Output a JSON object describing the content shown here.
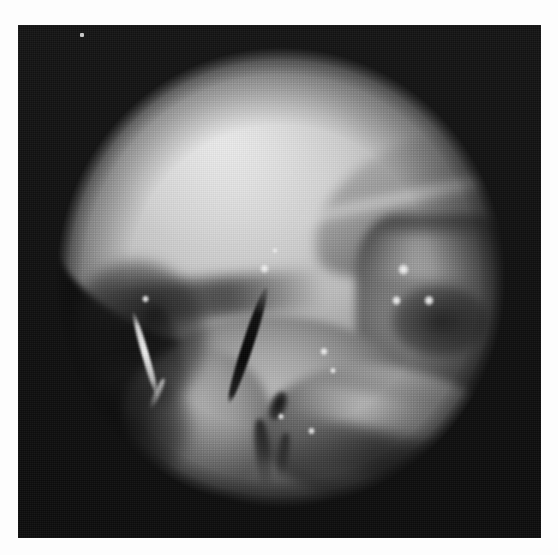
{
  "image": {
    "title": "Endoscopic grayscale photograph",
    "modality": "endoscopy",
    "color_mode": "grayscale",
    "width_px": 558,
    "height_px": 555,
    "border": {
      "color": "#fdfdfd",
      "left_px": 18,
      "top_px": 25,
      "right_px": 17,
      "bottom_px": 17
    },
    "plate": {
      "background_color": "#0e0e0e",
      "x_px": 18,
      "y_px": 25,
      "width_px": 523,
      "height_px": 513
    },
    "field_of_view": {
      "shape": "circle",
      "center_x_px": 263,
      "center_y_px": 253,
      "radius_px": 225,
      "description": "circular endoscope aperture with dark surround"
    },
    "dominant_colors": {
      "background_dark": "#101010",
      "tissue_bright": "#d8d8d8",
      "tissue_mid": "#8e8e8e",
      "tissue_shadow": "#3c3c3c",
      "specular_white": "#fcfcfc"
    },
    "structures": [
      {
        "name": "upper-tissue-dome",
        "description": "Large smooth bright dome-shaped tissue mass occupying the upper half",
        "brightness": "bright"
      },
      {
        "name": "upper-right-fold",
        "description": "Diagonal tissue fold along the upper right shoulder",
        "brightness": "mid"
      },
      {
        "name": "right-lateral-block",
        "description": "Ridged darker tissue block on the right side with specular highlights",
        "brightness": "mid-dark"
      },
      {
        "name": "lower-central-lobe",
        "description": "Rounded tissue lobe in the lower centre",
        "brightness": "mid-bright"
      },
      {
        "name": "lower-right-ridge",
        "description": "Curved banana-shaped ridge sweeping across the lower right",
        "brightness": "mid"
      },
      {
        "name": "central-dark-blade",
        "description": "Narrow dark blade-like instrument descending through the centre",
        "brightness": "very dark"
      },
      {
        "name": "left-bright-streak",
        "description": "Thin bright diagonal filament on the left side",
        "brightness": "very bright"
      },
      {
        "name": "left-dark-recess",
        "description": "Dark shadowed recess on the left of the field",
        "brightness": "dark"
      }
    ],
    "specular_highlights": [
      {
        "x_px": 240,
        "y_px": 268,
        "size_px": 9
      },
      {
        "x_px": 252,
        "y_px": 252,
        "size_px": 6
      },
      {
        "x_px": 378,
        "y_px": 268,
        "size_px": 11
      },
      {
        "x_px": 372,
        "y_px": 300,
        "size_px": 9
      },
      {
        "x_px": 404,
        "y_px": 300,
        "size_px": 10
      },
      {
        "x_px": 300,
        "y_px": 352,
        "size_px": 8
      },
      {
        "x_px": 310,
        "y_px": 372,
        "size_px": 6
      },
      {
        "x_px": 288,
        "y_px": 432,
        "size_px": 7
      },
      {
        "x_px": 258,
        "y_px": 418,
        "size_px": 6
      },
      {
        "x_px": 122,
        "y_px": 300,
        "size_px": 7
      }
    ],
    "artifacts": [
      {
        "name": "dust-speck",
        "x_px": 80,
        "y_px": 33,
        "width_px": 4,
        "height_px": 4
      },
      {
        "name": "halftone-screen",
        "description": "regular printed halftone dot pattern across the whole plate"
      }
    ]
  }
}
